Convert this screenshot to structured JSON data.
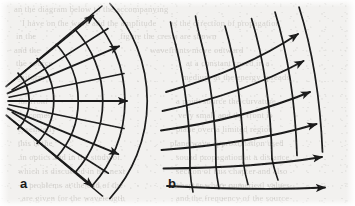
{
  "figure": {
    "background_color": "#f2f1ef",
    "ink_color": "#1a1a1a",
    "ghost_text_color": "#cfcdc9",
    "width": 355,
    "height": 206
  },
  "panels": [
    {
      "id": "a",
      "label": "a",
      "label_x": 20,
      "label_y": 176,
      "description": "diverging-ray-fan-with-concentric-wavefront-arcs"
    },
    {
      "id": "b",
      "label": "b",
      "label_x": 168,
      "label_y": 176,
      "description": "quasi-plane-wavefront-grid-with-parallel-rays"
    }
  ],
  "chart_data": {
    "type": "diagram",
    "title": "",
    "subtitle": "",
    "xlabel": "",
    "ylabel": "",
    "grid": false,
    "legend": null,
    "panels": [
      {
        "name": "a",
        "kind": "polar-fan",
        "apex": {
          "x": -16,
          "y": 101
        },
        "ray_count": 5,
        "ray_angles_deg": [
          -44,
          -22,
          0,
          21,
          43
        ],
        "ray_length": 152,
        "arc_count": 6,
        "arc_radii": [
          40,
          62,
          84,
          106,
          126,
          146
        ],
        "arrowheads": 5,
        "arrow_direction": "outward-radial"
      },
      {
        "name": "b",
        "kind": "curved-grid",
        "ray_count": 6,
        "ray_curvature": "slight-upward-bow",
        "arc_count": 6,
        "arrowheads": 6,
        "arrow_direction": "right-and-up-right",
        "x_extent": [
          162,
          348
        ],
        "y_extent": [
          12,
          196
        ]
      }
    ],
    "annotations": [
      {
        "text": "a",
        "x": 20,
        "y": 176
      },
      {
        "text": "b",
        "x": 168,
        "y": 176
      }
    ]
  },
  "ghost_text": {
    "lines": [
      {
        "text": "an the diagram below to the accompanying",
        "x": 14,
        "y": 4
      },
      {
        "text": "I have on the wave and the amplitude",
        "x": 22,
        "y": 18
      },
      {
        "text": "as the direction of propagation",
        "x": 170,
        "y": 18
      },
      {
        "text": "in the",
        "x": 16,
        "y": 31
      },
      {
        "text": "figure the crests are shown",
        "x": 120,
        "y": 31
      },
      {
        "text": "and the",
        "x": 14,
        "y": 45
      },
      {
        "text": "wavefronts move outward",
        "x": 150,
        "y": 45
      },
      {
        "text": "the source",
        "x": 16,
        "y": 58
      },
      {
        "text": "at a constant speed in a",
        "x": 186,
        "y": 58
      },
      {
        "text": "uniform",
        "x": 16,
        "y": 72
      },
      {
        "text": "medium as the energy spreads",
        "x": 182,
        "y": 72
      },
      {
        "text": "far from",
        "x": 18,
        "y": 96
      },
      {
        "text": "a point source the curvature",
        "x": 176,
        "y": 96
      },
      {
        "text": "becomes",
        "x": 20,
        "y": 110
      },
      {
        "text": "very small and the front is",
        "x": 178,
        "y": 110
      },
      {
        "text": "essentially",
        "x": 18,
        "y": 124
      },
      {
        "text": "plane over a limited region",
        "x": 176,
        "y": 124
      },
      {
        "text": "this is the",
        "x": 18,
        "y": 138
      },
      {
        "text": "plane wave approximation used",
        "x": 170,
        "y": 138
      },
      {
        "text": "in optics and in the study of",
        "x": 20,
        "y": 152
      },
      {
        "text": "sound propagation at a distance",
        "x": 176,
        "y": 152
      },
      {
        "text": "which is discussed in the next",
        "x": 18,
        "y": 166
      },
      {
        "text": "section of this chapter and also",
        "x": 176,
        "y": 166
      },
      {
        "text": "in problems at the end of the",
        "x": 20,
        "y": 180
      },
      {
        "text": "chapter where numerical values",
        "x": 176,
        "y": 180
      },
      {
        "text": "are given for the wavelength",
        "x": 22,
        "y": 193
      },
      {
        "text": "and the frequency of the source",
        "x": 176,
        "y": 193
      }
    ]
  }
}
